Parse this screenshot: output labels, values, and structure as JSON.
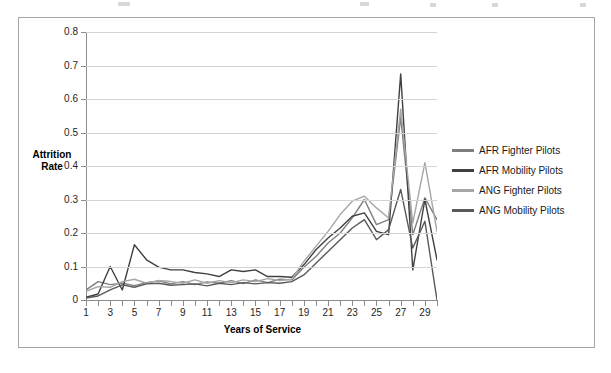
{
  "chart_data": {
    "type": "line",
    "title": "",
    "xlabel": "Years of Service",
    "ylabel": "Attrition Rate",
    "ylim": [
      0,
      0.8
    ],
    "xlim": [
      1,
      30
    ],
    "grid": true,
    "legend_position": "right",
    "y_ticks": [
      "0",
      "0.1",
      "0.2",
      "0.3",
      "0.4",
      "0.5",
      "0.6",
      "0.7",
      "0.8"
    ],
    "y_tick_values": [
      0,
      0.1,
      0.2,
      0.3,
      0.4,
      0.5,
      0.6,
      0.7,
      0.8
    ],
    "x_ticks": [
      "1",
      "3",
      "5",
      "7",
      "9",
      "11",
      "13",
      "15",
      "17",
      "19",
      "21",
      "23",
      "25",
      "27",
      "29"
    ],
    "x": [
      1,
      2,
      3,
      4,
      5,
      6,
      7,
      8,
      9,
      10,
      11,
      12,
      13,
      14,
      15,
      16,
      17,
      18,
      19,
      20,
      21,
      22,
      23,
      24,
      25,
      26,
      27,
      28,
      29,
      30
    ],
    "series": [
      {
        "name": "AFR Fighter Pilots",
        "color": "#7f7f7f",
        "values": [
          0.03,
          0.055,
          0.046,
          0.05,
          0.043,
          0.052,
          0.057,
          0.048,
          0.055,
          0.046,
          0.054,
          0.05,
          0.058,
          0.049,
          0.06,
          0.052,
          0.062,
          0.06,
          0.098,
          0.13,
          0.17,
          0.2,
          0.245,
          0.3,
          0.225,
          0.24,
          0.545,
          0.195,
          0.305,
          0.24
        ]
      },
      {
        "name": "AFR Mobility Pilots",
        "color": "#404040",
        "values": [
          0.008,
          0.018,
          0.1,
          0.03,
          0.165,
          0.12,
          0.098,
          0.09,
          0.09,
          0.082,
          0.078,
          0.07,
          0.09,
          0.085,
          0.09,
          0.07,
          0.07,
          0.068,
          0.105,
          0.15,
          0.185,
          0.215,
          0.25,
          0.26,
          0.205,
          0.195,
          0.675,
          0.09,
          0.3,
          0.12
        ]
      },
      {
        "name": "ANG Fighter Pilots",
        "color": "#a6a6a6",
        "values": [
          0.026,
          0.04,
          0.038,
          0.055,
          0.062,
          0.05,
          0.058,
          0.055,
          0.05,
          0.06,
          0.05,
          0.058,
          0.052,
          0.06,
          0.055,
          0.064,
          0.058,
          0.062,
          0.115,
          0.16,
          0.205,
          0.255,
          0.295,
          0.31,
          0.275,
          0.245,
          0.57,
          0.23,
          0.41,
          0.205
        ]
      },
      {
        "name": "ANG Mobility Pilots",
        "color": "#595959",
        "values": [
          0.006,
          0.012,
          0.03,
          0.045,
          0.038,
          0.048,
          0.05,
          0.044,
          0.046,
          0.048,
          0.042,
          0.05,
          0.046,
          0.052,
          0.048,
          0.052,
          0.05,
          0.055,
          0.075,
          0.11,
          0.145,
          0.18,
          0.215,
          0.24,
          0.18,
          0.21,
          0.33,
          0.155,
          0.235,
          0.0
        ]
      }
    ]
  },
  "legend": {
    "items": [
      {
        "label": "AFR Fighter Pilots"
      },
      {
        "label": "AFR Mobility Pilots"
      },
      {
        "label": "ANG Fighter Pilots"
      },
      {
        "label": "ANG Mobility Pilots"
      }
    ]
  }
}
